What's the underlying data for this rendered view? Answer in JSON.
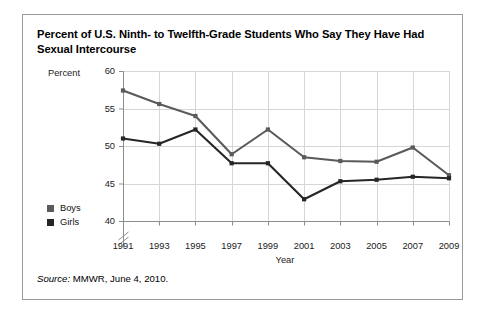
{
  "figure": {
    "title": "Percent of U.S. Ninth- to Twelfth-Grade Students Who Say They Have Had Sexual Intercourse",
    "source_label": "Source:",
    "source_text": " MMWR, June 4, 2010."
  },
  "chart_data": {
    "type": "line",
    "title": "Percent of U.S. Ninth- to Twelfth-Grade Students Who Say They Have Had Sexual Intercourse",
    "xlabel": "Year",
    "ylabel": "Percent",
    "categories": [
      "1991",
      "1993",
      "1995",
      "1997",
      "1999",
      "2001",
      "2003",
      "2005",
      "2007",
      "2009"
    ],
    "x": [
      1991,
      1993,
      1995,
      1997,
      1999,
      2001,
      2003,
      2005,
      2007,
      2009
    ],
    "xlim": [
      1991,
      2009
    ],
    "ylim": [
      40,
      60
    ],
    "yticks": [
      40,
      45,
      50,
      55,
      60
    ],
    "ytick_labels": [
      "40",
      "45",
      "50",
      "55",
      "60"
    ],
    "axis_break": true,
    "grid": true,
    "legend_position": "left-outside",
    "series": [
      {
        "name": "Boys",
        "color": "#5a5a5a",
        "values": [
          57.4,
          55.6,
          54.0,
          48.9,
          52.2,
          48.5,
          48.0,
          47.9,
          49.8,
          46.1
        ]
      },
      {
        "name": "Girls",
        "color": "#262626",
        "values": [
          51.0,
          50.3,
          52.2,
          47.7,
          47.7,
          42.9,
          45.3,
          45.5,
          45.9,
          45.7
        ]
      }
    ]
  },
  "colors": {
    "grid": "#d6d6d6",
    "axis": "#8d8d8d",
    "frame": "#9a9a9a",
    "text": "#111111"
  }
}
